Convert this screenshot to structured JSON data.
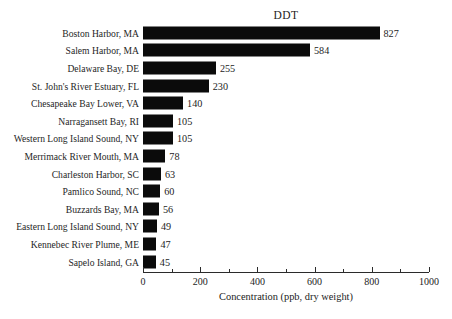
{
  "chart_data": {
    "type": "bar",
    "orientation": "horizontal",
    "title": "DDT",
    "xlabel": "Concentration (ppb, dry weight)",
    "ylabel": "",
    "xlim": [
      0,
      1000
    ],
    "grid": false,
    "legend": null,
    "categories": [
      "Boston Harbor, MA",
      "Salem Harbor, MA",
      "Delaware Bay, DE",
      "St. John's River Estuary, FL",
      "Chesapeake Bay Lower, VA",
      "Narragansett Bay, RI",
      "Western Long Island Sound, NY",
      "Merrimack River Mouth, MA",
      "Charleston Harbor, SC",
      "Pamlico Sound, NC",
      "Buzzards Bay, MA",
      "Eastern Long Island Sound, NY",
      "Kennebec River Plume, ME",
      "Sapelo Island, GA"
    ],
    "values": [
      827,
      584,
      255,
      230,
      140,
      105,
      105,
      78,
      63,
      60,
      56,
      49,
      47,
      45
    ],
    "value_labels": [
      "827",
      "584",
      "255",
      "230",
      "140",
      "105",
      "105",
      "78",
      "63",
      "60",
      "56",
      "49",
      "47",
      "45"
    ],
    "xticks": [
      0,
      200,
      400,
      600,
      800,
      1000
    ],
    "xtick_labels": [
      "0",
      "200",
      "400",
      "600",
      "800",
      "1000"
    ],
    "xminor_ticks": [
      100,
      300,
      500,
      700,
      900
    ],
    "bar_color": "#0b0b0b",
    "background_color": "#ffffff",
    "axis_color": "#2b2b2b"
  }
}
